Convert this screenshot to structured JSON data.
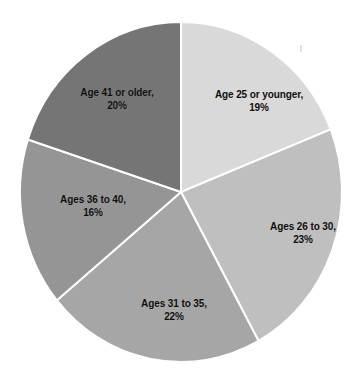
{
  "chart_data": {
    "type": "pie",
    "title": "",
    "subtitle": "",
    "xlabel": "",
    "ylabel": "",
    "legend_position": "none",
    "grid": false,
    "units": "percent",
    "start_angle_deg": 0,
    "direction": "clockwise",
    "categories": [
      "Age 25 or younger",
      "Ages 26 to 30",
      "Ages 31 to 35",
      "Ages 36 to 40",
      "Age 41 or older"
    ],
    "values": [
      19,
      23,
      22,
      16,
      20
    ],
    "colors": [
      "#d9d9d9",
      "#bfbfbf",
      "#a6a6a6",
      "#959595",
      "#757575"
    ],
    "slices": [
      {
        "name": "Age 25 or younger",
        "value": 19,
        "percent_label": "19%",
        "label_line1": "Age 25 or younger,",
        "label_line2": "19%",
        "color": "#d9d9d9",
        "label_x": 259,
        "label_y": 101
      },
      {
        "name": "Ages 26 to 30",
        "value": 23,
        "percent_label": "23%",
        "label_line1": "Ages 26 to 30,",
        "label_line2": "23%",
        "color": "#bfbfbf",
        "label_x": 303,
        "label_y": 233
      },
      {
        "name": "Ages 31 to 35",
        "value": 22,
        "percent_label": "22%",
        "label_line1": "Ages 31 to 35,",
        "label_line2": "22%",
        "color": "#a6a6a6",
        "label_x": 174,
        "label_y": 310
      },
      {
        "name": "Ages 36 to 40",
        "value": 16,
        "percent_label": "16%",
        "label_line1": "Ages 36 to 40,",
        "label_line2": "16%",
        "color": "#959595",
        "label_x": 93,
        "label_y": 206
      },
      {
        "name": "Age 41 or older",
        "value": 20,
        "percent_label": "20%",
        "label_line1": "Age 41 or older,",
        "label_line2": "20%",
        "color": "#757575",
        "label_x": 117,
        "label_y": 99
      }
    ],
    "geometry": {
      "center_x": 181,
      "center_y": 192,
      "radius_x": 161,
      "radius_y": 170,
      "divider_color": "#ffffff",
      "divider_width": 2,
      "background": "#ffffff"
    }
  }
}
